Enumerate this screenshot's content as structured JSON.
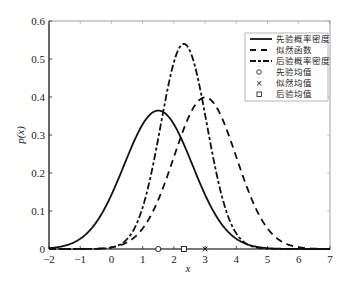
{
  "chart_data": {
    "type": "line",
    "title": "",
    "xlabel": "x",
    "ylabel": "p(x)",
    "xlim": [
      -2,
      7
    ],
    "ylim": [
      0,
      0.6
    ],
    "xticks": [
      -2,
      -1,
      0,
      1,
      2,
      3,
      4,
      5,
      6,
      7
    ],
    "yticks": [
      0,
      0.1,
      0.2,
      0.3,
      0.4,
      0.5,
      0.6
    ],
    "grid": false,
    "legend_position": "upper right",
    "series": [
      {
        "name": "先验概率密度",
        "style": "solid",
        "mean": 1.5,
        "std": 1.095,
        "peak": 0.365
      },
      {
        "name": "似然函数",
        "style": "dashed",
        "mean": 3.0,
        "std": 1.0,
        "peak": 0.399
      },
      {
        "name": "后验概率密度",
        "style": "dash-dot",
        "mean": 2.32,
        "std": 0.739,
        "peak": 0.54
      }
    ],
    "markers": [
      {
        "name": "先验均值",
        "symbol": "o",
        "x": 1.5,
        "y": 0
      },
      {
        "name": "似然均值",
        "symbol": "x",
        "x": 3.0,
        "y": 0
      },
      {
        "name": "后验均值",
        "symbol": "s",
        "x": 2.32,
        "y": 0
      }
    ]
  },
  "labels": {
    "xlabel": "x",
    "ylabel": "p(x)",
    "xticks": [
      "−2",
      "−1",
      "0",
      "1",
      "2",
      "3",
      "4",
      "5",
      "6",
      "7"
    ],
    "yticks": [
      "0",
      "0.1",
      "0.2",
      "0.3",
      "0.4",
      "0.5",
      "0.6"
    ],
    "legend": [
      "先验概率密度",
      "似然函数",
      "后验概率密度",
      "先验均值",
      "似然均值",
      "后验均值"
    ]
  }
}
